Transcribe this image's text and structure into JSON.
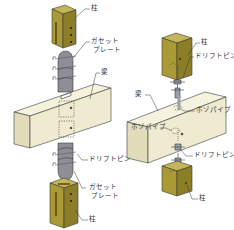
{
  "colors": {
    "post_front": "#a99a35",
    "post_side": "#8c7e26",
    "post_top": "#c4b556",
    "beam_front": "#efebd0",
    "beam_top": "#f5f2de",
    "beam_side": "#e2dcba",
    "plate": "#8e8e96",
    "plate_dark": "#5d5d66",
    "pin": "#9aa0a8",
    "line": "#3a3a3a",
    "label": "#333333"
  },
  "left_diagram": {
    "title": "gusset plate joint",
    "labels": {
      "post_top": "柱",
      "gusset_top_1": "ガセット",
      "gusset_top_2": "プレート",
      "beam": "梁",
      "drift_pin": "ドリフトピン",
      "gusset_bottom_1": "ガセット",
      "gusset_bottom_2": "プレート",
      "post_bottom": "柱"
    }
  },
  "right_diagram": {
    "title": "hozo pipe joint",
    "labels": {
      "post_top": "柱",
      "drift_pin_top": "ドリフトピン",
      "beam": "梁",
      "hozo_pipe_top": "ホゾパイプ",
      "hozo_pipe_bottom": "ホゾパイプ",
      "drift_pin_bottom": "ドリフトピン",
      "post_bottom": "柱"
    }
  }
}
